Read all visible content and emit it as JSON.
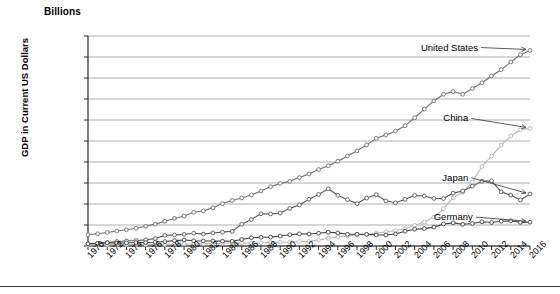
{
  "chart_data": {
    "type": "line",
    "title": "",
    "unit_label": "Billions",
    "ylabel": "GDP in Current US Dollars",
    "xlabel": "",
    "ylim": [
      0,
      20000
    ],
    "ytick_values": [
      0,
      2000,
      4000,
      6000,
      8000,
      10000,
      12000,
      14000,
      16000,
      18000,
      20000
    ],
    "ytick_labels": [
      "$0",
      "$2,000",
      "$4,000",
      "$6,000",
      "$8,000",
      "$10,000",
      "$12,000",
      "$14,000",
      "$16,000",
      "$18,000",
      "$20,000"
    ],
    "xlim": [
      1970,
      2016
    ],
    "x": [
      1970,
      1971,
      1972,
      1973,
      1974,
      1975,
      1976,
      1977,
      1978,
      1979,
      1980,
      1981,
      1982,
      1983,
      1984,
      1985,
      1986,
      1987,
      1988,
      1989,
      1990,
      1991,
      1992,
      1993,
      1994,
      1995,
      1996,
      1997,
      1998,
      1999,
      2000,
      2001,
      2002,
      2003,
      2004,
      2005,
      2006,
      2007,
      2008,
      2009,
      2010,
      2011,
      2012,
      2013,
      2014,
      2015,
      2016
    ],
    "xtick_labels": [
      "1970",
      "1972",
      "1974",
      "1976",
      "1978",
      "1980",
      "1982",
      "1984",
      "1986",
      "1988",
      "1990",
      "1992",
      "1994",
      "1996",
      "1998",
      "2000",
      "2002",
      "2004",
      "2006",
      "2008",
      "2010",
      "2012",
      "2014",
      "2016"
    ],
    "xtick_step": 2,
    "grid": "horizontal",
    "legend_position": "inline-right-annotations",
    "marker": "open-circle",
    "series": [
      {
        "name": "United States",
        "color": "#6e6e6e",
        "label_x": 2011,
        "label_y": 18900,
        "values": [
          1073,
          1165,
          1279,
          1425,
          1545,
          1685,
          1873,
          2082,
          2352,
          2627,
          2857,
          3207,
          3344,
          3634,
          4038,
          4339,
          4580,
          4856,
          5237,
          5642,
          5963,
          6158,
          6520,
          6859,
          7287,
          7640,
          8073,
          8578,
          9063,
          9631,
          10252,
          10582,
          10936,
          11458,
          12214,
          13037,
          13815,
          14452,
          14713,
          14449,
          14992,
          15543,
          16197,
          16785,
          17522,
          18219,
          18625
        ]
      },
      {
        "name": "China",
        "color": "#b5b5b5",
        "label_x": 2010,
        "label_y": 12150,
        "values": [
          92,
          99,
          113,
          138,
          144,
          163,
          152,
          172,
          150,
          178,
          191,
          196,
          205,
          230,
          259,
          309,
          300,
          273,
          310,
          348,
          361,
          383,
          427,
          444,
          564,
          734,
          863,
          962,
          1029,
          1094,
          1211,
          1339,
          1471,
          1660,
          1955,
          2286,
          2752,
          3552,
          4598,
          5110,
          6101,
          7573,
          8561,
          9607,
          10482,
          11065,
          11199
        ]
      },
      {
        "name": "Japan",
        "color": "#585858",
        "label_x": 2010,
        "label_y": 6500,
        "values": [
          213,
          241,
          319,
          432,
          479,
          521,
          586,
          707,
          1013,
          1054,
          1105,
          1218,
          1134,
          1243,
          1319,
          1399,
          2076,
          2521,
          3072,
          3054,
          3133,
          3585,
          3909,
          4454,
          4907,
          5449,
          4834,
          4415,
          4040,
          4563,
          4888,
          4304,
          4115,
          4446,
          4815,
          4755,
          4530,
          4515,
          5038,
          5231,
          5700,
          6157,
          6203,
          5156,
          4850,
          4383,
          4949
        ]
      },
      {
        "name": "Germany",
        "color": "#404040",
        "label_x": 2009,
        "label_y": 2750,
        "values": [
          216,
          248,
          306,
          276,
          292,
          327,
          330,
          357,
          427,
          513,
          571,
          500,
          483,
          477,
          461,
          447,
          620,
          784,
          836,
          846,
          949,
          1070,
          1158,
          1137,
          1217,
          1310,
          1246,
          1114,
          1121,
          1108,
          1055,
          1050,
          1143,
          1407,
          1600,
          1657,
          1798,
          2100,
          2200,
          2067,
          2145,
          2306,
          2232,
          2360,
          2400,
          2250,
          2270
        ]
      }
    ]
  }
}
